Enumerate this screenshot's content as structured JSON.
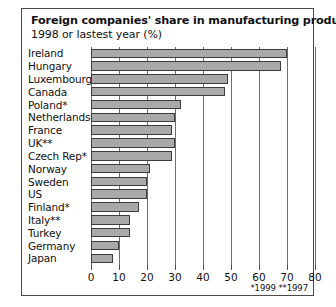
{
  "chart_data": {
    "type": "bar",
    "orientation": "horizontal",
    "title": "Foreign companies' share in manufacturing production",
    "subtitle": "1998 or lastest year (%)",
    "xlabel": "",
    "ylabel": "",
    "xlim": [
      0,
      80
    ],
    "xticks": [
      0,
      10,
      20,
      30,
      40,
      50,
      60,
      70,
      80
    ],
    "xtick_labels": [
      "0",
      "10",
      "20",
      "30",
      "40",
      "50",
      "60",
      "70",
      "80"
    ],
    "grid": true,
    "legend": "none",
    "footnote": "*1999 **1997",
    "bar_color": "#a9a9a9",
    "bar_border_color": "#3c3c3c",
    "categories": [
      "Ireland",
      "Hungary",
      "Luxembourg",
      "Canada",
      "Poland*",
      "Netherlands",
      "France",
      "UK**",
      "Czech Rep*",
      "Norway",
      "Sweden",
      "US",
      "Finland*",
      "Italy**",
      "Turkey",
      "Germany",
      "Japan"
    ],
    "values": [
      70,
      68,
      49,
      48,
      32,
      30,
      29,
      30,
      29,
      21,
      20,
      20,
      17,
      14,
      14,
      10,
      8
    ]
  }
}
